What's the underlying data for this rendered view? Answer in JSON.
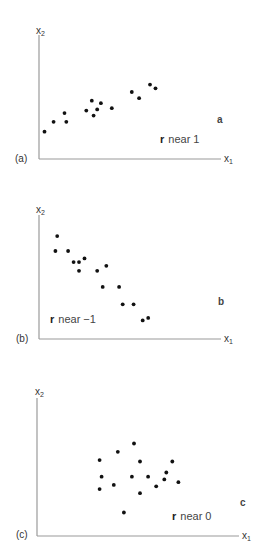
{
  "chart_data": [
    {
      "type": "scatter",
      "panel_label": "(a)",
      "corner_letter": "a",
      "annotation": {
        "r_symbol": "r",
        "text": "near  1"
      },
      "xlabel": "x",
      "xlabel_sub": "1",
      "ylabel": "x",
      "ylabel_sub": "2",
      "xlim": [
        0,
        100
      ],
      "ylim": [
        0,
        100
      ],
      "grid": false,
      "points": [
        [
          3,
          22
        ],
        [
          8,
          30
        ],
        [
          14,
          37
        ],
        [
          15,
          30
        ],
        [
          26,
          39
        ],
        [
          29,
          47
        ],
        [
          30,
          35
        ],
        [
          32,
          40
        ],
        [
          34,
          45
        ],
        [
          40,
          41
        ],
        [
          51,
          54
        ],
        [
          55,
          49
        ],
        [
          61,
          60
        ],
        [
          64,
          57
        ]
      ]
    },
    {
      "type": "scatter",
      "panel_label": "(b)",
      "corner_letter": "b",
      "annotation": {
        "r_symbol": "r",
        "text": "near −1"
      },
      "xlabel": "x",
      "xlabel_sub": "1",
      "ylabel": "x",
      "ylabel_sub": "2",
      "xlim": [
        0,
        100
      ],
      "ylim": [
        0,
        100
      ],
      "grid": false,
      "points": [
        [
          10,
          83
        ],
        [
          9,
          71
        ],
        [
          16,
          71
        ],
        [
          19,
          62
        ],
        [
          22,
          62
        ],
        [
          25,
          65
        ],
        [
          22,
          55
        ],
        [
          32,
          55
        ],
        [
          37,
          59
        ],
        [
          35,
          42
        ],
        [
          44,
          42
        ],
        [
          46,
          28
        ],
        [
          52,
          28
        ],
        [
          57,
          15
        ],
        [
          60,
          17
        ]
      ]
    },
    {
      "type": "scatter",
      "panel_label": "(c)",
      "corner_letter": "c",
      "annotation": {
        "r_symbol": "r",
        "text": "near  0"
      },
      "xlabel": "x",
      "xlabel_sub": "1",
      "ylabel": "x",
      "ylabel_sub": "2",
      "xlim": [
        0,
        100
      ],
      "ylim": [
        0,
        100
      ],
      "grid": false,
      "points": [
        [
          31,
          55
        ],
        [
          40,
          61
        ],
        [
          48,
          67
        ],
        [
          51,
          54
        ],
        [
          67,
          54
        ],
        [
          32,
          43
        ],
        [
          47,
          43
        ],
        [
          55,
          43
        ],
        [
          64,
          46
        ],
        [
          63,
          41
        ],
        [
          31,
          34
        ],
        [
          38,
          37
        ],
        [
          51,
          31
        ],
        [
          59,
          36
        ],
        [
          70,
          39
        ],
        [
          43,
          17
        ]
      ]
    }
  ]
}
